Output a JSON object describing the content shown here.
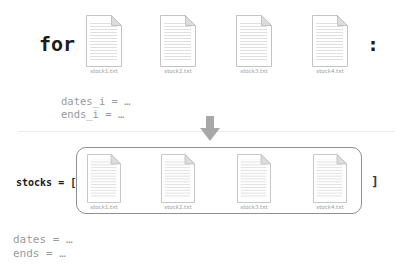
{
  "loop_section": {
    "keyword": "for",
    "colon": ":",
    "files": [
      "stock1.txt",
      "stock2.txt",
      "stock3.txt",
      "stock4.txt"
    ],
    "body_lines": [
      "dates_i = …",
      "ends_i = …"
    ]
  },
  "list_section": {
    "label": "stocks = [",
    "closing_bracket": "]",
    "files": [
      "stock1.txt",
      "stock2.txt",
      "stock3.txt",
      "stock4.txt"
    ],
    "after_lines": [
      "dates = …",
      "ends = …"
    ]
  },
  "icons": {
    "arrow": "down-arrow",
    "file": "document"
  },
  "colors": {
    "code_text": "#1c1c1c",
    "muted_text": "#9a9a9a",
    "box_border": "#8f8f8f",
    "arrow": "#a8a8a8",
    "divider": "#ebebeb",
    "doc_border": "#c3c3c3",
    "doc_fold": "#dcdcdc",
    "doc_lines": "#dcdcdc"
  }
}
